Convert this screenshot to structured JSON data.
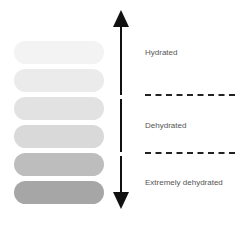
{
  "diagram": {
    "pills": [
      {
        "level": 1,
        "color": "#f3f3f3"
      },
      {
        "level": 2,
        "color": "#ebebeb"
      },
      {
        "level": 3,
        "color": "#e2e2e2"
      },
      {
        "level": 4,
        "color": "#d9d9d9"
      },
      {
        "level": 5,
        "color": "#bdbdbd"
      },
      {
        "level": 6,
        "color": "#a6a6a6"
      }
    ],
    "labels": {
      "hydrated": "Hydrated",
      "dehydrated": "Dehydrated",
      "extremely_dehydrated": "Extremely dehydrated"
    },
    "arrow": {
      "direction": "bidirectional-vertical",
      "color": "#111111"
    },
    "dividers": {
      "style": "dashed",
      "count": 2
    }
  }
}
